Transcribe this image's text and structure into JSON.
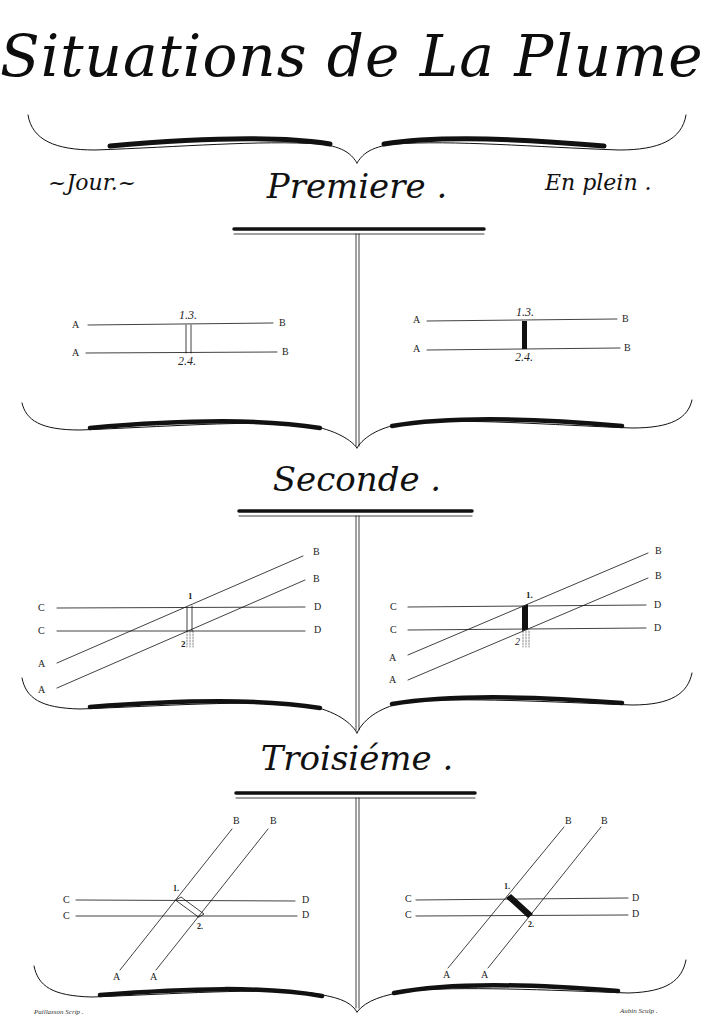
{
  "plate": {
    "title": "Situations de La Plume .",
    "left_heading": "~Jour.~",
    "right_heading": "En plein .",
    "credits": {
      "left": "Paillasson Scrip .",
      "right": "Aubin Sculp ."
    }
  },
  "sections": [
    {
      "name": "Premiere",
      "title": "Premiere .",
      "left_figure": {
        "state": "Jour (open stroke)",
        "line_labels": [
          "A",
          "A",
          "B",
          "B"
        ],
        "top_numbers": "1.3.",
        "bottom_numbers": "2.4."
      },
      "right_figure": {
        "state": "En plein (filled stroke)",
        "line_labels": [
          "A",
          "A",
          "B",
          "B"
        ],
        "top_numbers": "1.3.",
        "bottom_numbers": "2.4."
      }
    },
    {
      "name": "Seconde",
      "title": "Seconde .",
      "left_figure": {
        "state": "Jour (open stroke)",
        "horizontal_labels_left": [
          "C",
          "C"
        ],
        "horizontal_labels_right": [
          "D",
          "D"
        ],
        "diagonal_labels_start": [
          "A",
          "A"
        ],
        "diagonal_labels_end": [
          "B",
          "B"
        ],
        "top_number": "1",
        "bottom_number": "2"
      },
      "right_figure": {
        "state": "En plein (filled stroke)",
        "horizontal_labels_left": [
          "C",
          "C"
        ],
        "horizontal_labels_right": [
          "D",
          "D"
        ],
        "diagonal_labels_start": [
          "A",
          "A"
        ],
        "diagonal_labels_end": [
          "B",
          "B"
        ],
        "top_number": "1.",
        "bottom_number": "2"
      }
    },
    {
      "name": "Troisieme",
      "title": "Troisiéme .",
      "left_figure": {
        "state": "Jour (open stroke)",
        "horizontal_labels_left": [
          "C",
          "C"
        ],
        "horizontal_labels_right": [
          "D",
          "D"
        ],
        "diagonal_labels_start": [
          "A",
          "A"
        ],
        "diagonal_labels_end": [
          "B",
          "B"
        ],
        "top_number": "1.",
        "bottom_number": "2."
      },
      "right_figure": {
        "state": "En plein (filled stroke)",
        "horizontal_labels_left": [
          "C",
          "C"
        ],
        "horizontal_labels_right": [
          "D",
          "D"
        ],
        "diagonal_labels_start": [
          "A",
          "A"
        ],
        "diagonal_labels_end": [
          "B",
          "B"
        ],
        "top_number": "1.",
        "bottom_number": "2."
      }
    }
  ],
  "colors": {
    "ink": "#111111",
    "paper": "#ffffff"
  }
}
